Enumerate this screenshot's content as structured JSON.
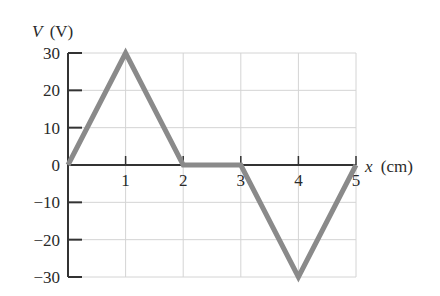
{
  "chart_data": {
    "type": "line",
    "title": "",
    "xlabel": "x (cm)",
    "ylabel": "V (V)",
    "x_label_var": "x",
    "x_label_unit": "(cm)",
    "y_label_var": "V",
    "y_label_unit": "(V)",
    "x": [
      0,
      1,
      2,
      3,
      4,
      5
    ],
    "series": [
      {
        "name": "V(x)",
        "values": [
          0,
          30,
          0,
          0,
          -30,
          0
        ],
        "color": "#8a8a8a"
      }
    ],
    "xlim": [
      0,
      5
    ],
    "ylim": [
      -30,
      30
    ],
    "x_ticks": [
      1,
      2,
      3,
      4,
      5
    ],
    "x_tick_labels": [
      "1",
      "2",
      "3",
      "4",
      "5"
    ],
    "y_ticks": [
      30,
      20,
      10,
      0,
      -10,
      -20,
      -30
    ],
    "y_tick_labels": [
      "30",
      "20",
      "10",
      "0",
      "−10",
      "−20",
      "−30"
    ],
    "grid": true,
    "legend": "none"
  },
  "colors": {
    "line": "#8a8a8a",
    "axis": "#333333",
    "grid": "#d4d4d4"
  }
}
